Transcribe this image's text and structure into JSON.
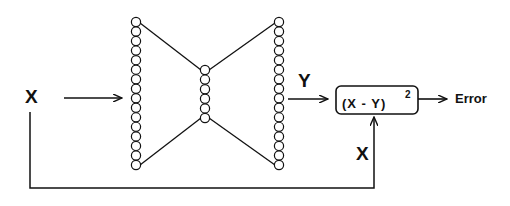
{
  "diagram": {
    "type": "autoencoder-reconstruction-error",
    "input_label": "X",
    "output_label": "Y",
    "feedback_label": "X",
    "error_box": {
      "expression": "(X - Y)",
      "exponent": "2"
    },
    "result_label": "Error",
    "layers": [
      {
        "name": "input",
        "neurons": 16
      },
      {
        "name": "bottleneck",
        "neurons": 6
      },
      {
        "name": "output",
        "neurons": 16
      }
    ],
    "colors": {
      "stroke": "#111111",
      "background": "#ffffff"
    }
  }
}
